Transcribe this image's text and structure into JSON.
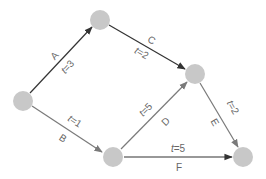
{
  "diagram": {
    "type": "activity-network",
    "colors": {
      "node_fill": "#c8c8c8",
      "critical_edge": "#333333",
      "normal_edge": "#7a7a7a",
      "label_text": "#666666",
      "background": "#ffffff"
    },
    "nodes": [
      {
        "id": "n1",
        "x": 23,
        "y": 101,
        "r": 10
      },
      {
        "id": "n2",
        "x": 100,
        "y": 20,
        "r": 10
      },
      {
        "id": "n3",
        "x": 195,
        "y": 74,
        "r": 10
      },
      {
        "id": "n4",
        "x": 113,
        "y": 157,
        "r": 10
      },
      {
        "id": "n5",
        "x": 243,
        "y": 157,
        "r": 10
      }
    ],
    "edges": [
      {
        "id": "A",
        "from": "n1",
        "to": "n2",
        "label": "A",
        "time_var": "t",
        "time_value": "=3",
        "critical": true
      },
      {
        "id": "B",
        "from": "n1",
        "to": "n4",
        "label": "B",
        "time_var": "t",
        "time_value": "=1",
        "critical": false
      },
      {
        "id": "C",
        "from": "n2",
        "to": "n3",
        "label": "C",
        "time_var": "t",
        "time_value": "=2",
        "critical": true
      },
      {
        "id": "D",
        "from": "n4",
        "to": "n3",
        "label": "D",
        "time_var": "t",
        "time_value": "=5",
        "critical": false
      },
      {
        "id": "E",
        "from": "n3",
        "to": "n5",
        "label": "E",
        "time_var": "t",
        "time_value": "=2",
        "critical": false
      },
      {
        "id": "F",
        "from": "n4",
        "to": "n5",
        "label": "F",
        "time_var": "t",
        "time_value": "=5",
        "critical": false
      }
    ]
  }
}
